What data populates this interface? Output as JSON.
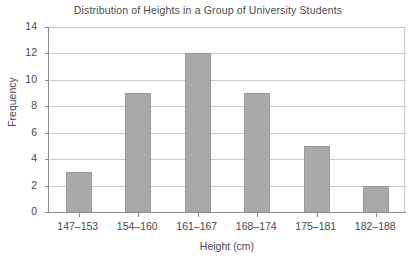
{
  "chart_data": {
    "type": "bar",
    "title": "Distribution of Heights in a Group of University Students",
    "xlabel": "Height (cm)",
    "ylabel": "Frequency",
    "categories": [
      "147–153",
      "154–160",
      "161–167",
      "168–174",
      "175–181",
      "182–188"
    ],
    "values": [
      3,
      9,
      12,
      9,
      5,
      2
    ],
    "ylim": [
      0,
      14
    ],
    "ytick_values": [
      0,
      2,
      4,
      6,
      8,
      10,
      12,
      14
    ],
    "ytick_labels": [
      "0",
      "2",
      "4",
      "6",
      "8",
      "10",
      "12",
      "14"
    ],
    "grid": "horizontal",
    "legend": "none",
    "bar_color": "#a9a9a9",
    "bar_edge_color": "#9a9a9a",
    "gridline_color": "#c9c9c9",
    "axis_color": "#8d8d8d",
    "text_color": "#4a4a4a",
    "background": "#ffffff"
  }
}
